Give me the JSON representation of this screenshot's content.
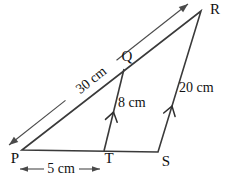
{
  "figure": {
    "background_color": "#ffffff",
    "fill_color": "#d9d9d9",
    "fill_stripe_color": "#d1d1d1",
    "line_color": "#3a3a3a",
    "vertices": {
      "p": "P",
      "q": "Q",
      "r": "R",
      "s": "S",
      "t": "T"
    },
    "measurements": {
      "pr_length": "30 cm",
      "qt_length": "8 cm",
      "sr_length": "20 cm",
      "pt_length": "5 cm"
    }
  }
}
